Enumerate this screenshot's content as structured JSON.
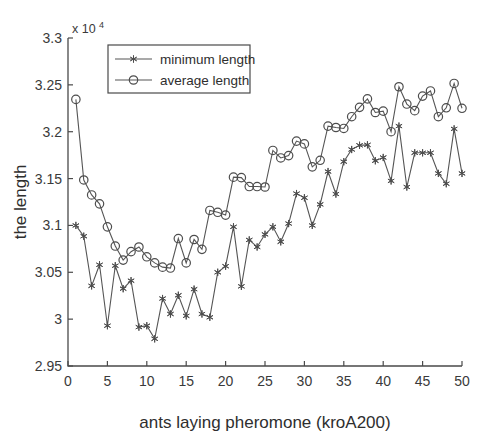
{
  "chart_data": {
    "type": "line",
    "title": "",
    "xlabel": "ants laying pheromone (kroA200)",
    "ylabel": "the length",
    "y_exponent_label": "x 10",
    "y_exponent_power": "4",
    "y_scale": 10000,
    "xlim": [
      0,
      50
    ],
    "ylim": [
      2.95,
      3.3
    ],
    "xticks": [
      0,
      5,
      10,
      15,
      20,
      25,
      30,
      35,
      40,
      45,
      50
    ],
    "xtick_labels": [
      "0",
      "5",
      "10",
      "15",
      "20",
      "25",
      "30",
      "35",
      "40",
      "45",
      "50"
    ],
    "yticks": [
      2.95,
      3,
      3.05,
      3.1,
      3.15,
      3.2,
      3.25,
      3.3
    ],
    "ytick_labels": [
      "2.95",
      "3",
      "3.05",
      "3.1",
      "3.15",
      "3.2",
      "3.25",
      "3.3"
    ],
    "grid": false,
    "legend_position": "top-left",
    "x": [
      1,
      2,
      3,
      4,
      5,
      6,
      7,
      8,
      9,
      10,
      11,
      12,
      13,
      14,
      15,
      16,
      17,
      18,
      19,
      20,
      21,
      22,
      23,
      24,
      25,
      26,
      27,
      28,
      29,
      30,
      31,
      32,
      33,
      34,
      35,
      36,
      37,
      38,
      39,
      40,
      41,
      42,
      43,
      44,
      45,
      46,
      47,
      48,
      49,
      50
    ],
    "series": [
      {
        "name": "minimum length",
        "marker": "star",
        "line_style": "solid",
        "color": "#555555",
        "values": [
          3.1,
          3.0885,
          3.0355,
          3.058,
          2.993,
          3.057,
          3.0325,
          3.041,
          2.9915,
          2.993,
          2.979,
          3.022,
          3.0055,
          3.0255,
          3.0035,
          3.032,
          3.0055,
          3.002,
          3.05,
          3.0565,
          3.0985,
          3.035,
          3.0845,
          3.077,
          3.0905,
          3.0985,
          3.0825,
          3.102,
          3.134,
          3.1295,
          3.1,
          3.1225,
          3.1575,
          3.1335,
          3.168,
          3.181,
          3.1855,
          3.186,
          3.169,
          3.1725,
          3.1475,
          3.206,
          3.141,
          3.1775,
          3.1775,
          3.1775,
          3.1555,
          3.1445,
          3.203,
          3.1555
        ]
      },
      {
        "name": "average length",
        "marker": "circle",
        "line_style": "solid",
        "color": "#555555",
        "values": [
          3.2345,
          3.1485,
          3.1325,
          3.123,
          3.0985,
          3.078,
          3.063,
          3.072,
          3.077,
          3.0665,
          3.06,
          3.0555,
          3.0545,
          3.086,
          3.06,
          3.085,
          3.0745,
          3.116,
          3.114,
          3.111,
          3.1515,
          3.151,
          3.1415,
          3.1415,
          3.141,
          3.18,
          3.172,
          3.1745,
          3.19,
          3.187,
          3.1625,
          3.1695,
          3.206,
          3.2045,
          3.2035,
          3.216,
          3.226,
          3.235,
          3.2205,
          3.222,
          3.2,
          3.248,
          3.2295,
          3.2225,
          3.238,
          3.2435,
          3.216,
          3.2255,
          3.2515,
          3.225
        ]
      }
    ]
  },
  "legend": {
    "entries": [
      {
        "label": "minimum length"
      },
      {
        "label": "average length"
      }
    ]
  }
}
